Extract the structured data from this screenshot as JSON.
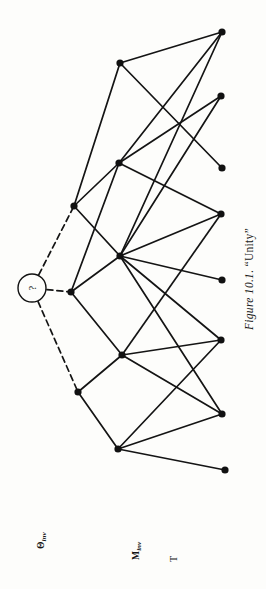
{
  "figure": {
    "caption_prefix": "Figure 10.1.",
    "caption_quoted": "“Unity”",
    "caption_full": "Figure 10.1. “Unity”"
  },
  "tier_labels": [
    {
      "id": "theta-inv",
      "base": "Θ",
      "sub": "inv",
      "text": "Θinv"
    },
    {
      "id": "m-inv",
      "base": "M",
      "sub": "inv",
      "text": "Minv"
    },
    {
      "id": "t",
      "base": "T",
      "sub": "",
      "text": "T"
    }
  ],
  "root_node": {
    "label": "?",
    "shape": "circle",
    "cx": 32,
    "cy": 288,
    "r": 14
  },
  "colors": {
    "background": "#fdfdfb",
    "ink": "#111111",
    "edge": "#141414"
  },
  "nodes": [
    {
      "id": "a1",
      "tier": "theta-inv",
      "x": 74,
      "y": 206
    },
    {
      "id": "a2",
      "tier": "theta-inv",
      "x": 71,
      "y": 292
    },
    {
      "id": "a3",
      "tier": "theta-inv",
      "x": 78,
      "y": 392
    },
    {
      "id": "b1",
      "tier": "m-inv",
      "x": 120,
      "y": 63
    },
    {
      "id": "b2",
      "tier": "m-inv",
      "x": 119,
      "y": 163
    },
    {
      "id": "b3",
      "tier": "m-inv",
      "x": 120,
      "y": 256
    },
    {
      "id": "b4",
      "tier": "m-inv",
      "x": 122,
      "y": 355
    },
    {
      "id": "b5",
      "tier": "m-inv",
      "x": 118,
      "y": 449
    },
    {
      "id": "c1",
      "tier": "t",
      "x": 222,
      "y": 32
    },
    {
      "id": "c2",
      "tier": "t",
      "x": 221,
      "y": 96
    },
    {
      "id": "c3",
      "tier": "t",
      "x": 222,
      "y": 168
    },
    {
      "id": "c4",
      "tier": "t",
      "x": 221,
      "y": 214
    },
    {
      "id": "c5",
      "tier": "t",
      "x": 222,
      "y": 280
    },
    {
      "id": "c6",
      "tier": "t",
      "x": 221,
      "y": 340
    },
    {
      "id": "c7",
      "tier": "t",
      "x": 222,
      "y": 414
    },
    {
      "id": "c8",
      "tier": "t",
      "x": 225,
      "y": 470
    }
  ],
  "dashed_edges": [
    {
      "from": "root",
      "to": "a1"
    },
    {
      "from": "root",
      "to": "a2"
    },
    {
      "from": "root",
      "to": "a3"
    }
  ],
  "solid_edges": [
    {
      "from": "a1",
      "to": "b1"
    },
    {
      "from": "a1",
      "to": "b2"
    },
    {
      "from": "a1",
      "to": "b3"
    },
    {
      "from": "a2",
      "to": "b2"
    },
    {
      "from": "a2",
      "to": "b3"
    },
    {
      "from": "a2",
      "to": "b4"
    },
    {
      "from": "a3",
      "to": "b4"
    },
    {
      "from": "a3",
      "to": "b5"
    },
    {
      "from": "b1",
      "to": "c1"
    },
    {
      "from": "b1",
      "to": "c3"
    },
    {
      "from": "b2",
      "to": "c1"
    },
    {
      "from": "b2",
      "to": "c2"
    },
    {
      "from": "b2",
      "to": "c4"
    },
    {
      "from": "b3",
      "to": "c1"
    },
    {
      "from": "b3",
      "to": "c2"
    },
    {
      "from": "b3",
      "to": "c4"
    },
    {
      "from": "b3",
      "to": "c5"
    },
    {
      "from": "b3",
      "to": "c6"
    },
    {
      "from": "b3",
      "to": "c7"
    },
    {
      "from": "b4",
      "to": "c4"
    },
    {
      "from": "b4",
      "to": "c6"
    },
    {
      "from": "b4",
      "to": "c7"
    },
    {
      "from": "b5",
      "to": "c6"
    },
    {
      "from": "b5",
      "to": "c7"
    },
    {
      "from": "b5",
      "to": "c8"
    }
  ],
  "geometry": {
    "node_radius": 3.6,
    "edge_width": 1.7,
    "dash_pattern": "6,4"
  },
  "label_positions": {
    "theta_inv": {
      "left": 36,
      "top": 549
    },
    "m_inv": {
      "left": 131,
      "top": 560
    },
    "t": {
      "left": 168,
      "top": 562
    },
    "caption": {
      "left": 243,
      "top": 330
    }
  }
}
